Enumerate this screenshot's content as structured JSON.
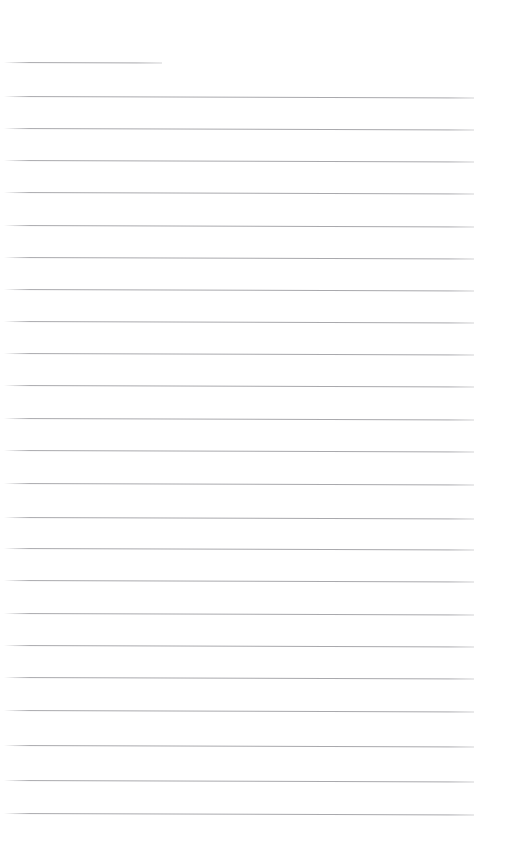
{
  "page": {
    "kind": "lined-paper",
    "title": "",
    "width": 505,
    "height": 850,
    "background_color": "#ffffff",
    "rule_color": "#a9a9ad",
    "content_text": "",
    "is_blank": true,
    "note": "Blank ruled page: no headings, labels, numbers or other rendered text are present in the pixels."
  },
  "ruling": {
    "line_count": 24,
    "first_line_y": 62,
    "line_spacing": 32.3,
    "left_margin_x": 4,
    "right_margin_x": 474,
    "line_thickness": 1,
    "slope_deg": 0.18,
    "lines": [
      {
        "index": 1,
        "y": 62,
        "x_start": 4,
        "x_end": 162,
        "variant": "short"
      },
      {
        "index": 2,
        "y": 96,
        "x_start": 4,
        "x_end": 474,
        "variant": "full"
      },
      {
        "index": 3,
        "y": 128,
        "x_start": 4,
        "x_end": 474,
        "variant": "full"
      },
      {
        "index": 4,
        "y": 160,
        "x_start": 4,
        "x_end": 474,
        "variant": "full"
      },
      {
        "index": 5,
        "y": 192,
        "x_start": 4,
        "x_end": 474,
        "variant": "full"
      },
      {
        "index": 6,
        "y": 225,
        "x_start": 4,
        "x_end": 474,
        "variant": "full"
      },
      {
        "index": 7,
        "y": 257,
        "x_start": 4,
        "x_end": 474,
        "variant": "full"
      },
      {
        "index": 8,
        "y": 289,
        "x_start": 4,
        "x_end": 474,
        "variant": "full"
      },
      {
        "index": 9,
        "y": 321,
        "x_start": 4,
        "x_end": 474,
        "variant": "full"
      },
      {
        "index": 10,
        "y": 353,
        "x_start": 4,
        "x_end": 474,
        "variant": "full"
      },
      {
        "index": 11,
        "y": 385,
        "x_start": 4,
        "x_end": 474,
        "variant": "full"
      },
      {
        "index": 12,
        "y": 418,
        "x_start": 4,
        "x_end": 474,
        "variant": "full"
      },
      {
        "index": 13,
        "y": 450,
        "x_start": 4,
        "x_end": 474,
        "variant": "full"
      },
      {
        "index": 14,
        "y": 483,
        "x_start": 4,
        "x_end": 474,
        "variant": "full"
      },
      {
        "index": 15,
        "y": 517,
        "x_start": 4,
        "x_end": 474,
        "variant": "full"
      },
      {
        "index": 16,
        "y": 548,
        "x_start": 4,
        "x_end": 474,
        "variant": "full"
      },
      {
        "index": 17,
        "y": 580,
        "x_start": 4,
        "x_end": 474,
        "variant": "full"
      },
      {
        "index": 18,
        "y": 613,
        "x_start": 4,
        "x_end": 474,
        "variant": "full"
      },
      {
        "index": 19,
        "y": 645,
        "x_start": 4,
        "x_end": 474,
        "variant": "full"
      },
      {
        "index": 20,
        "y": 677,
        "x_start": 4,
        "x_end": 474,
        "variant": "full"
      },
      {
        "index": 21,
        "y": 710,
        "x_start": 4,
        "x_end": 474,
        "variant": "full"
      },
      {
        "index": 22,
        "y": 745,
        "x_start": 4,
        "x_end": 474,
        "variant": "full"
      },
      {
        "index": 23,
        "y": 780,
        "x_start": 4,
        "x_end": 474,
        "variant": "full"
      },
      {
        "index": 24,
        "y": 813,
        "x_start": 4,
        "x_end": 474,
        "variant": "full"
      }
    ]
  },
  "text_items": []
}
